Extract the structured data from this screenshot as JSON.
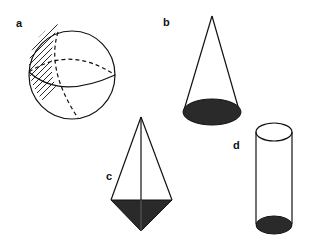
{
  "panels": [
    {
      "label": "a",
      "shape": "sphere"
    },
    {
      "label": "b",
      "shape": "cone"
    },
    {
      "label": "c",
      "shape": "triangular-pyramid"
    },
    {
      "label": "d",
      "shape": "cylinder"
    }
  ],
  "colors": {
    "line": "#111111",
    "fill": "#2a2a2a",
    "background": "#ffffff"
  }
}
